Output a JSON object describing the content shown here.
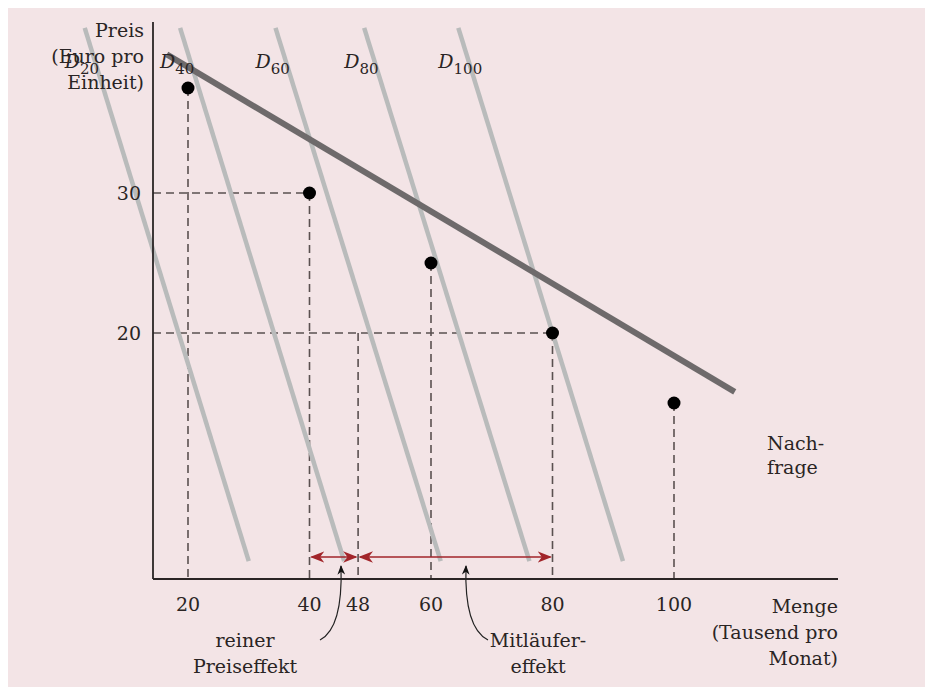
{
  "chart_data": {
    "type": "line",
    "title": "",
    "ylabel": [
      "Preis",
      "(Euro pro",
      "Einheit)"
    ],
    "xlabel": [
      "Menge",
      "(Tausend pro",
      "Monat)"
    ],
    "xlim": [
      0,
      110
    ],
    "ylim": [
      0,
      42
    ],
    "x_ticks": [
      20,
      40,
      48,
      60,
      80,
      100
    ],
    "y_ticks": [
      20,
      30
    ],
    "grid": false,
    "demand_curve": {
      "name": "Nachfrage",
      "label_lines": [
        "Nach-",
        "frage"
      ],
      "x": [
        16.5,
        110
      ],
      "y": [
        39.9,
        15.8
      ]
    },
    "individual_demand_curves": [
      {
        "name": "D",
        "subscript": "20",
        "x": [
          3,
          30
        ],
        "y": [
          41.8,
          3.7
        ]
      },
      {
        "name": "D",
        "subscript": "40",
        "x": [
          18.7,
          45.7
        ],
        "y": [
          41.8,
          3.7
        ]
      },
      {
        "name": "D",
        "subscript": "60",
        "x": [
          34.4,
          61.6
        ],
        "y": [
          41.8,
          3.7
        ]
      },
      {
        "name": "D",
        "subscript": "80",
        "x": [
          49,
          76.2
        ],
        "y": [
          41.8,
          3.7
        ]
      },
      {
        "name": "D",
        "subscript": "100",
        "x": [
          64.5,
          91.6
        ],
        "y": [
          41.8,
          3.7
        ]
      }
    ],
    "points": [
      {
        "x": 20,
        "y": 37.5
      },
      {
        "x": 40,
        "y": 30
      },
      {
        "x": 60,
        "y": 25
      },
      {
        "x": 80,
        "y": 20
      },
      {
        "x": 100,
        "y": 15
      }
    ],
    "guides": [
      {
        "from": [
          0,
          30
        ],
        "to": [
          40,
          30
        ]
      },
      {
        "from": [
          0,
          20
        ],
        "to": [
          80,
          20
        ]
      },
      {
        "from": [
          20,
          37.5
        ],
        "to": [
          20,
          0
        ]
      },
      {
        "from": [
          40,
          30
        ],
        "to": [
          40,
          0
        ]
      },
      {
        "from": [
          48,
          20
        ],
        "to": [
          48,
          0
        ]
      },
      {
        "from": [
          60,
          25
        ],
        "to": [
          60,
          0
        ]
      },
      {
        "from": [
          80,
          20
        ],
        "to": [
          80,
          0
        ]
      },
      {
        "from": [
          100,
          15
        ],
        "to": [
          100,
          0
        ]
      }
    ],
    "effects": [
      {
        "name": "reiner Preiseffekt",
        "label_lines": [
          "reiner",
          "Preiseffekt"
        ],
        "from": 40,
        "to": 48
      },
      {
        "name": "Mitläufereffekt",
        "label_lines": [
          "Mitläufer-",
          "effekt"
        ],
        "from": 48,
        "to": 80
      }
    ],
    "colors": {
      "background": "#f3e4e6",
      "demand": "#6e6a6b",
      "individual_demand": "#b9bbbb",
      "axis": "#2a2424",
      "guide": "#5a5050",
      "arrow": "#a2252a",
      "point": "#000000"
    }
  }
}
